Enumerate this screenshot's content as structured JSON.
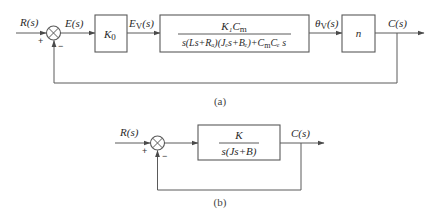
{
  "diagram_a": {
    "caption": "(a)",
    "input_label": "R(s)",
    "error_label": "E(s)",
    "ev_label_main": "E",
    "ev_label_sub": "V",
    "ev_label_tail": "(s)",
    "k0_main": "K",
    "k0_sub": "0",
    "plant_numerator": "K₁C",
    "plant_numerator_sub": "m",
    "plant_denominator": "s(Ls+Rₐ)(Jₑs+Bₑ)+C",
    "plant_denominator_tail_sub": "m",
    "plant_denominator_tail": "Cₑ s",
    "theta_main": "θ",
    "theta_sub": "V",
    "theta_tail": "(s)",
    "gear_label": "n",
    "output_label": "C(s)",
    "plus_sign": "+",
    "minus_sign": "−"
  },
  "diagram_b": {
    "caption": "(b)",
    "input_label": "R(s)",
    "plant_numerator": "K",
    "plant_denominator": "s(Js+B)",
    "output_label": "C(s)",
    "plus_sign": "+",
    "minus_sign": "−"
  }
}
